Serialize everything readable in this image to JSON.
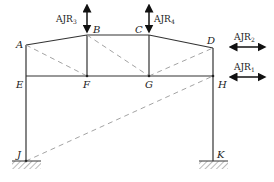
{
  "diagram": {
    "type": "structural frame",
    "colors": {
      "member": "#333333",
      "dashed": "#999999",
      "hatch": "#555555"
    },
    "nodes": {
      "A": {
        "label": "A",
        "x": 26,
        "y": 45
      },
      "B": {
        "label": "B",
        "x": 87,
        "y": 35
      },
      "C": {
        "label": "C",
        "x": 149,
        "y": 35
      },
      "D": {
        "label": "D",
        "x": 213,
        "y": 48
      },
      "E": {
        "label": "E",
        "x": 26,
        "y": 76
      },
      "F": {
        "label": "F",
        "x": 87,
        "y": 76
      },
      "G": {
        "label": "G",
        "x": 149,
        "y": 76
      },
      "H": {
        "label": "H",
        "x": 213,
        "y": 76
      },
      "J": {
        "label": "J",
        "x": 26,
        "y": 161
      },
      "K": {
        "label": "K",
        "x": 213,
        "y": 161
      }
    },
    "members": [
      [
        "A",
        "B"
      ],
      [
        "B",
        "C"
      ],
      [
        "C",
        "D"
      ],
      [
        "E",
        "H"
      ],
      [
        "A",
        "J"
      ],
      [
        "D",
        "K"
      ],
      [
        "B",
        "F"
      ],
      [
        "C",
        "G"
      ]
    ],
    "dashed_members": [
      [
        "A",
        "F"
      ],
      [
        "B",
        "G"
      ],
      [
        "G",
        "D"
      ],
      [
        "J",
        "H"
      ]
    ],
    "supports": [
      {
        "node": "J",
        "type": "fixed"
      },
      {
        "node": "K",
        "type": "fixed"
      }
    ],
    "loads": [
      {
        "label": "AJR",
        "sub": "3",
        "node": "B",
        "direction": "vertical"
      },
      {
        "label": "AJR",
        "sub": "4",
        "node": "C",
        "direction": "vertical"
      },
      {
        "label": "AJR",
        "sub": "2",
        "at": "D",
        "direction": "horizontal"
      },
      {
        "label": "AJR",
        "sub": "1",
        "at": "H",
        "direction": "horizontal"
      }
    ]
  }
}
